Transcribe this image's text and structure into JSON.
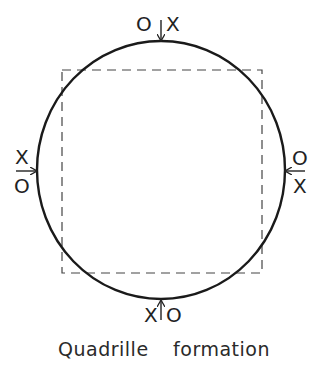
{
  "diagram": {
    "caption": "Quadrille formation",
    "shape": "circle",
    "inner_square": "dashed",
    "positions": [
      {
        "side": "top",
        "left": "O",
        "right": "X",
        "arrow": "down"
      },
      {
        "side": "left",
        "top": "X",
        "bottom": "O",
        "arrow": "right"
      },
      {
        "side": "right",
        "top": "O",
        "bottom": "X",
        "arrow": "left"
      },
      {
        "side": "bottom",
        "left": "X",
        "right": "O",
        "arrow": "up"
      }
    ],
    "colors": {
      "line": "#222222",
      "background": "#ffffff"
    }
  },
  "labels": {
    "top_left": "O",
    "top_right": "X",
    "left_top": "X",
    "left_bottom": "O",
    "right_top": "O",
    "right_bottom": "X",
    "bottom_left": "X",
    "bottom_right": "O"
  }
}
